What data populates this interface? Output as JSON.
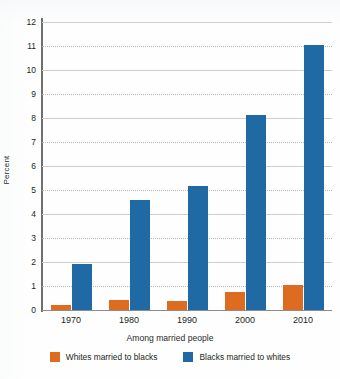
{
  "chart_data": {
    "type": "bar",
    "title": "",
    "subtitle": "",
    "xlabel": "Among married people",
    "ylabel": "Percent",
    "categories": [
      "1970",
      "1980",
      "1990",
      "2000",
      "2010"
    ],
    "series": [
      {
        "name": "Whites married to blacks",
        "color": "#dd6b20",
        "values": [
          0.2,
          0.42,
          0.38,
          0.75,
          1.05
        ]
      },
      {
        "name": "Blacks married to whites",
        "color": "#1f6aa5",
        "values": [
          1.9,
          4.6,
          5.17,
          8.13,
          11.05
        ]
      }
    ],
    "ylim": [
      0,
      12
    ],
    "ytick_labels": [
      "0",
      "1",
      "2",
      "3",
      "4",
      "5",
      "6",
      "7",
      "8",
      "9",
      "10",
      "11",
      "12"
    ],
    "ytick_values": [
      0,
      1,
      2,
      3,
      4,
      5,
      6,
      7,
      8,
      9,
      10,
      11,
      12
    ],
    "grid": "horizontal-dotted",
    "legend_position": "bottom"
  },
  "axes": {
    "y_label": "Percent",
    "x_label": "Among married people"
  },
  "legend": {
    "items": [
      {
        "label": "Whites married to blacks",
        "color": "#dd6b20",
        "swatch": "orange-swatch"
      },
      {
        "label": "Blacks married to whites",
        "color": "#1f6aa5",
        "swatch": "blue-swatch"
      }
    ]
  },
  "colors": {
    "series_orange": "#dd6b20",
    "series_blue": "#1f6aa5",
    "gridline": "#b9b9b9",
    "axis": "#6f6f6f",
    "text": "#231f20",
    "background": "#ffffff"
  }
}
